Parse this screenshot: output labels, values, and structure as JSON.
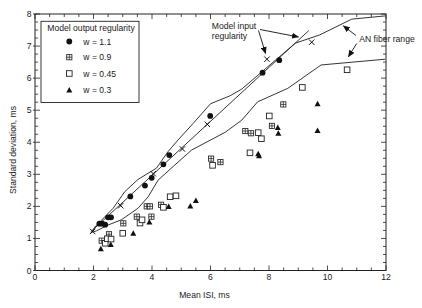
{
  "chart_data": {
    "type": "scatter",
    "title": "",
    "xlabel": "Mean ISI, ms",
    "ylabel": "Standard deviation, ms",
    "xlim": [
      0,
      12
    ],
    "ylim": [
      0,
      8
    ],
    "xticks": [
      0,
      2,
      4,
      6,
      8,
      10,
      12
    ],
    "yticks": [
      0,
      1,
      2,
      3,
      4,
      5,
      6,
      7,
      8
    ],
    "grid": false,
    "legend": {
      "title": "Model output regularity",
      "position": "upper left"
    },
    "series": [
      {
        "name": "w = 1.1",
        "marker": "filled-circle",
        "points": [
          [
            2.2,
            1.46
          ],
          [
            2.3,
            1.46
          ],
          [
            2.4,
            1.43
          ],
          [
            2.5,
            1.66
          ],
          [
            2.6,
            1.66
          ],
          [
            3.26,
            2.31
          ],
          [
            3.76,
            2.65
          ],
          [
            3.99,
            2.89
          ],
          [
            4.39,
            3.31
          ],
          [
            4.59,
            3.6
          ],
          [
            5.99,
            4.82
          ],
          [
            7.78,
            6.17
          ],
          [
            8.35,
            6.56
          ]
        ]
      },
      {
        "name": "w = 0.9",
        "marker": "plus-square",
        "points": [
          [
            2.28,
            0.93
          ],
          [
            2.53,
            1.13
          ],
          [
            3.02,
            1.47
          ],
          [
            3.48,
            1.68
          ],
          [
            3.98,
            1.68
          ],
          [
            3.82,
            2.0
          ],
          [
            3.93,
            2.0
          ],
          [
            4.31,
            2.05
          ],
          [
            6.02,
            3.49
          ],
          [
            6.34,
            3.38
          ],
          [
            7.19,
            4.35
          ],
          [
            7.38,
            4.28
          ],
          [
            8.1,
            4.51
          ],
          [
            8.49,
            5.18
          ]
        ]
      },
      {
        "name": "w = 0.45",
        "marker": "open-square",
        "points": [
          [
            2.4,
            0.85
          ],
          [
            2.47,
            0.99
          ],
          [
            2.6,
            0.98
          ],
          [
            3.0,
            1.16
          ],
          [
            3.59,
            1.48
          ],
          [
            3.66,
            1.58
          ],
          [
            4.39,
            1.97
          ],
          [
            4.62,
            2.3
          ],
          [
            4.82,
            2.33
          ],
          [
            6.07,
            3.28
          ],
          [
            7.35,
            3.67
          ],
          [
            7.63,
            4.3
          ],
          [
            7.74,
            4.11
          ],
          [
            8.01,
            4.82
          ],
          [
            9.14,
            5.71
          ],
          [
            10.67,
            6.26
          ]
        ]
      },
      {
        "name": "w = 0.3",
        "marker": "filled-triangle",
        "points": [
          [
            2.25,
            0.67
          ],
          [
            2.59,
            0.8
          ],
          [
            3.36,
            1.15
          ],
          [
            3.91,
            1.5
          ],
          [
            4.57,
            1.99
          ],
          [
            5.31,
            2.0
          ],
          [
            5.5,
            2.17
          ],
          [
            7.63,
            3.63
          ],
          [
            7.66,
            3.57
          ],
          [
            8.3,
            4.45
          ],
          [
            8.32,
            4.27
          ],
          [
            9.66,
            5.19
          ],
          [
            9.66,
            4.36
          ]
        ]
      }
    ],
    "lines": [
      {
        "name": "Model input regularity",
        "marker": "x-cross",
        "points": [
          [
            1.9,
            1.2
          ],
          [
            9.36,
            7.48
          ]
        ],
        "marker_points": [
          [
            1.97,
            1.22
          ],
          [
            2.93,
            2.02
          ],
          [
            4.04,
            3.02
          ],
          [
            5.04,
            3.79
          ],
          [
            5.89,
            4.56
          ],
          [
            7.93,
            6.59
          ],
          [
            9.46,
            7.12
          ]
        ]
      },
      {
        "name": "AN fiber range (upper bound)",
        "points": [
          [
            1.94,
            1.19
          ],
          [
            2.04,
            1.35
          ],
          [
            2.67,
            1.94
          ],
          [
            3.07,
            2.46
          ],
          [
            3.52,
            2.84
          ],
          [
            4.15,
            3.19
          ],
          [
            4.55,
            3.71
          ],
          [
            4.89,
            4.07
          ],
          [
            5.41,
            4.59
          ],
          [
            6.0,
            5.2
          ],
          [
            6.67,
            5.45
          ],
          [
            7.07,
            5.66
          ],
          [
            8.9,
            7.09
          ],
          [
            9.74,
            7.35
          ],
          [
            10.83,
            7.84
          ],
          [
            11.97,
            7.94
          ]
        ]
      },
      {
        "name": "AN fiber range (lower bound)",
        "points": [
          [
            1.94,
            1.19
          ],
          [
            2.11,
            1.24
          ],
          [
            2.5,
            1.42
          ],
          [
            2.95,
            1.58
          ],
          [
            3.52,
            1.94
          ],
          [
            3.87,
            2.3
          ],
          [
            4.21,
            2.82
          ],
          [
            4.73,
            3.25
          ],
          [
            5.36,
            3.76
          ],
          [
            6.5,
            4.31
          ],
          [
            7.07,
            4.69
          ],
          [
            7.61,
            5.26
          ],
          [
            8.64,
            5.68
          ],
          [
            9.78,
            6.41
          ],
          [
            11.97,
            6.59
          ]
        ]
      }
    ],
    "annotations": [
      {
        "text": "Model input regularity",
        "lines": [
          "Model input",
          "regularity"
        ]
      },
      {
        "text": "AN fiber range",
        "lines": [
          "AN fiber range"
        ]
      }
    ]
  },
  "colors": {
    "background": "#ffffff",
    "ink": "#111111",
    "line": "#2a2a2a"
  }
}
